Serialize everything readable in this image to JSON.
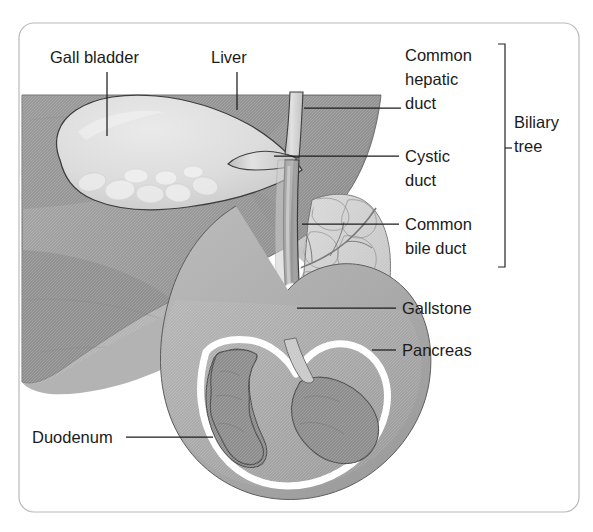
{
  "figure": {
    "frame": {
      "border_color": "#b9b9b9",
      "background_color": "#ffffff"
    }
  },
  "labels": {
    "gall_bladder": "Gall bladder",
    "liver": "Liver",
    "common_hepatic_duct_l1": "Common",
    "common_hepatic_duct_l2": "hepatic",
    "common_hepatic_duct_l3": "duct",
    "cystic_duct_l1": "Cystic",
    "cystic_duct_l2": "duct",
    "common_bile_duct_l1": "Common",
    "common_bile_duct_l2": "bile duct",
    "biliary_tree_l1": "Biliary",
    "biliary_tree_l2": "tree",
    "gallstone": "Gallstone",
    "pancreas": "Pancreas",
    "duodenum": "Duodenum"
  },
  "structures": [
    {
      "name": "liver",
      "label": "Liver",
      "fill": "#9d9d9d"
    },
    {
      "name": "gall-bladder",
      "label": "Gall bladder",
      "fill": "#d6d6d6"
    },
    {
      "name": "common-hepatic-duct",
      "label": "Common hepatic duct",
      "fill": "#cfcfcf"
    },
    {
      "name": "cystic-duct",
      "label": "Cystic duct",
      "fill": "#cfcfcf"
    },
    {
      "name": "common-bile-duct",
      "label": "Common bile duct",
      "fill": "#8f8f8f"
    },
    {
      "name": "gallstone",
      "label": "Gallstone",
      "fill": "#ffffff"
    },
    {
      "name": "pancreas",
      "label": "Pancreas",
      "fill": "#cdcdcd"
    },
    {
      "name": "duodenum",
      "label": "Duodenum",
      "fill": "#b0b0b0"
    }
  ],
  "colors": {
    "liver_dark": "#8b8b8b",
    "liver_mid": "#9d9d9d",
    "gall_bladder_light": "#dedede",
    "duct_light": "#d2d2d2",
    "duct_dark": "#7e7e7e",
    "pancreas": "#cdcdcd",
    "duodenum_wall": "#b2b2b2",
    "duodenum_lumen": "#8d8d8d",
    "stone_white": "#ffffff",
    "outline": "#3a3a3a",
    "label_text": "#1b1b1b",
    "frame_border": "#b9b9b9"
  },
  "leaders": {
    "gall_bladder": {
      "x1": 107,
      "y1": 72,
      "x2": 107,
      "y2": 135
    },
    "liver": {
      "x1": 237,
      "y1": 72,
      "x2": 237,
      "y2": 110
    },
    "common_hepatic_duct": {
      "x1": 305,
      "y1": 108,
      "x2": 400,
      "y2": 108
    },
    "cystic_duct": {
      "x1": 276,
      "y1": 156,
      "x2": 399,
      "y2": 156
    },
    "common_bile_duct": {
      "x1": 303,
      "y1": 224,
      "x2": 399,
      "y2": 224
    },
    "gallstone": {
      "x1": 299,
      "y1": 308,
      "x2": 396,
      "y2": 308
    },
    "pancreas": {
      "x1": 374,
      "y1": 350,
      "x2": 396,
      "y2": 350
    },
    "duodenum": {
      "x1": 126,
      "y1": 437,
      "x2": 212,
      "y2": 437
    }
  },
  "bracket": {
    "name": "biliary-tree-bracket",
    "x": 505,
    "top": 44,
    "bottom": 267,
    "tick": 7,
    "mid": 148
  }
}
